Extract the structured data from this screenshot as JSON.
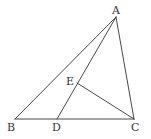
{
  "diagram": {
    "type": "geometry",
    "points": {
      "A": {
        "label": "A",
        "x": 116,
        "y": 17
      },
      "B": {
        "label": "B",
        "x": 15,
        "y": 119
      },
      "C": {
        "label": "C",
        "x": 134,
        "y": 119
      },
      "D": {
        "label": "D",
        "x": 57,
        "y": 119
      },
      "E": {
        "label": "E",
        "x": 77,
        "y": 83
      }
    },
    "segments": [
      "AB",
      "AC",
      "BC",
      "AD",
      "EC"
    ],
    "colors": {
      "stroke": "#333333",
      "background": "#ffffff"
    }
  }
}
